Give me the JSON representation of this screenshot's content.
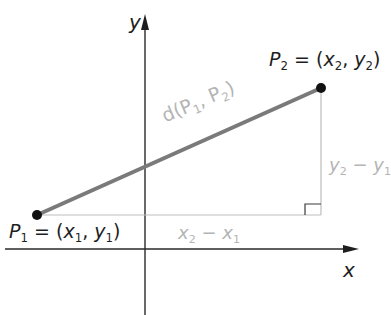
{
  "diagram": {
    "axes": {
      "x_label": "x",
      "y_label": "y"
    },
    "points": {
      "p1": {
        "name": "P",
        "sub": "1",
        "eq": " = (",
        "x": "x",
        "x_sub": "1",
        "comma": ", ",
        "y": "y",
        "y_sub": "1",
        "close": ")"
      },
      "p2": {
        "name": "P",
        "sub": "2",
        "eq": " = (",
        "x": "x",
        "x_sub": "2",
        "comma": ", ",
        "y": "y",
        "y_sub": "2",
        "close": ")"
      }
    },
    "segment_label": {
      "prefix": "d(P",
      "sub1": "1",
      "mid": ", P",
      "sub2": "2",
      "suffix": ")"
    },
    "horizontal_leg": {
      "a": "x",
      "a_sub": "2",
      "op": " − ",
      "b": "x",
      "b_sub": "1"
    },
    "vertical_leg": {
      "a": "y",
      "a_sub": "2",
      "op": " − ",
      "b": "y",
      "b_sub": "1"
    },
    "colors": {
      "axis": "#2a2a2a",
      "segment": "#7a7a7a",
      "legs": "#bdbdbd",
      "point": "#111111",
      "gray_text": "#b4b4b4",
      "dark_text": "#1e1e1e"
    }
  }
}
